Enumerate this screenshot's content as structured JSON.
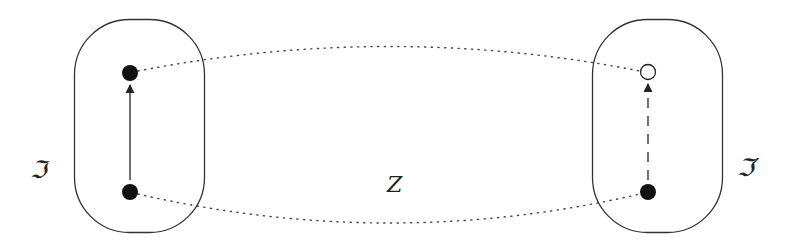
{
  "diagram": {
    "left_set": {
      "label": "ℑ",
      "nodes": [
        {
          "id": "left-top",
          "style": "filled"
        },
        {
          "id": "left-bottom",
          "style": "filled"
        }
      ],
      "edge": {
        "from": "left-bottom",
        "to": "left-top",
        "style": "solid-arrow"
      }
    },
    "right_set": {
      "label": "ℑ′",
      "nodes": [
        {
          "id": "right-top",
          "style": "open"
        },
        {
          "id": "right-bottom",
          "style": "filled"
        }
      ],
      "edge": {
        "from": "right-bottom",
        "to": "right-top",
        "style": "dashed-arrow"
      }
    },
    "correspondences": [
      {
        "from": "left-top",
        "to": "right-top",
        "style": "dotted"
      },
      {
        "from": "left-bottom",
        "to": "right-bottom",
        "style": "dotted"
      }
    ],
    "center_label": "Z",
    "colors": {
      "stroke": "#222222",
      "background": "#ffffff"
    }
  }
}
